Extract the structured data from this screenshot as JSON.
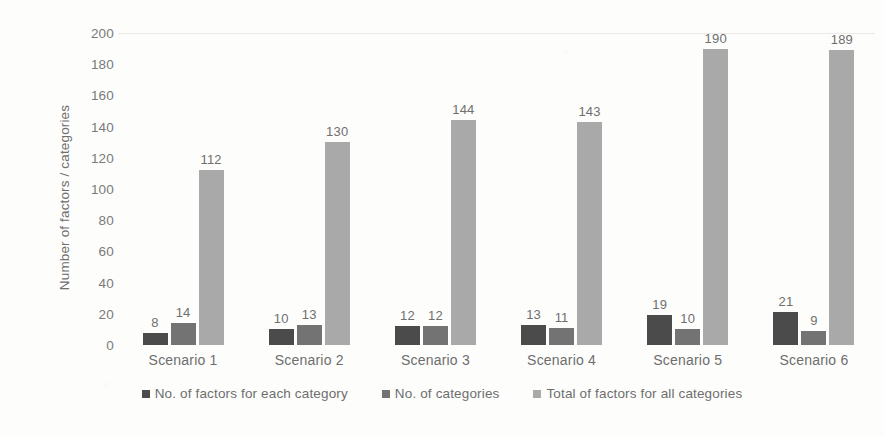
{
  "chart_data": {
    "type": "bar",
    "title": "",
    "subtitle": "",
    "xlabel": "",
    "ylabel": "Number of factors / categories",
    "ylim": [
      0,
      200
    ],
    "ytick_step": 20,
    "yticks": [
      200,
      180,
      160,
      140,
      120,
      100,
      80,
      60,
      40,
      20,
      0
    ],
    "categories": [
      "Scenario 1",
      "Scenario 2",
      "Scenario 3",
      "Scenario 4",
      "Scenario 5",
      "Scenario 6"
    ],
    "grid": true,
    "legend_position": "bottom",
    "colors": {
      "series_0": "#4b4b4b",
      "series_1": "#737373",
      "series_2": "#a9a9a9",
      "background": "#fdfdfc",
      "text": "#6e6e6e",
      "gridline": "#f1f0ee"
    },
    "series": [
      {
        "name": "No. of factors for each category",
        "color": "#4b4b4b",
        "values": [
          8,
          10,
          12,
          13,
          19,
          21
        ]
      },
      {
        "name": "No. of categories",
        "color": "#737373",
        "values": [
          14,
          13,
          12,
          11,
          10,
          9
        ]
      },
      {
        "name": "Total of factors for all categories",
        "color": "#a9a9a9",
        "values": [
          112,
          130,
          144,
          143,
          190,
          189
        ]
      }
    ],
    "data_labels_shown": true
  },
  "legend": {
    "items": [
      {
        "label": "No. of factors for each category",
        "swatch": "series-0-swatch"
      },
      {
        "label": "No. of categories",
        "swatch": "series-1-swatch"
      },
      {
        "label": "Total of factors for all categories",
        "swatch": "series-2-swatch"
      }
    ]
  }
}
